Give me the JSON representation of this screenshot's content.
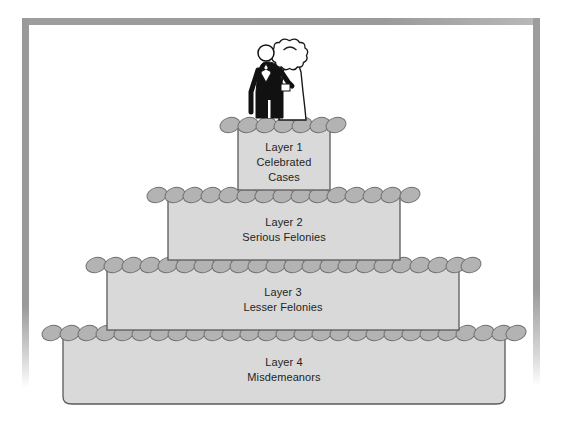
{
  "diagram": {
    "type": "layered-pyramid-cake",
    "background_color": "#ffffff",
    "frame": {
      "name": "page-border-frame",
      "color": "#9a9a9a",
      "thickness_px": 7
    },
    "palette": {
      "tier_body_fill": "#d9d9d9",
      "tier_body_stroke": "#595959",
      "trim_fill": "#b3b3b3",
      "trim_stroke": "#6b6b6b",
      "text_color": "#231f20",
      "groom_color": "#111111",
      "bride_color": "#ffffff"
    },
    "topper": {
      "name": "wedding-couple-topper",
      "figures": [
        "groom",
        "bride"
      ],
      "description": "Groom in black tuxedo beside bride in white gown with veil"
    },
    "tiers": [
      {
        "id": "layer-1",
        "line1": "Layer 1",
        "line2": "Celebrated",
        "line3": "Cases",
        "width_px": 92,
        "order": 1
      },
      {
        "id": "layer-2",
        "line1": "Layer 2",
        "line2": "Serious Felonies",
        "line3": "",
        "width_px": 232,
        "order": 2
      },
      {
        "id": "layer-3",
        "line1": "Layer 3",
        "line2": "Lesser Felonies",
        "line3": "",
        "width_px": 352,
        "order": 3
      },
      {
        "id": "layer-4",
        "line1": "Layer 4",
        "line2": "Misdemeanors",
        "line3": "",
        "width_px": 450,
        "order": 4
      }
    ]
  }
}
